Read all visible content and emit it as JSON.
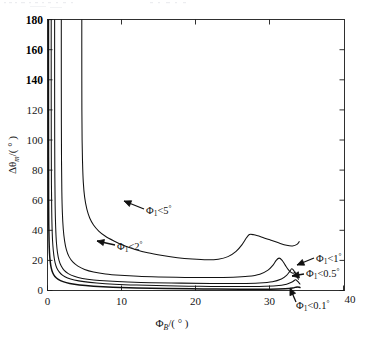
{
  "figure": {
    "background": "#ffffff",
    "ink_color": "#111111",
    "width": 368,
    "height": 337
  },
  "chart_data": {
    "type": "line",
    "title": "",
    "subtitle": "",
    "xlabel": "Φ_B/(°)",
    "ylabel": "Δθ_m/(°)",
    "xlabel_parts": {
      "symbol": "Φ",
      "sub": "B",
      "unit": "/( ° )"
    },
    "ylabel_parts": {
      "symbol": "Δθ",
      "sub": "m",
      "unit": "/( ° )"
    },
    "xlim": [
      0,
      40
    ],
    "ylim": [
      0,
      180
    ],
    "xticks": [
      0,
      10,
      20,
      30,
      40
    ],
    "xticklabels": [
      "0",
      "10",
      "20",
      "30",
      "40"
    ],
    "yticks": [
      0,
      20,
      40,
      60,
      80,
      100,
      120,
      140,
      160,
      180
    ],
    "yticklabels": [
      "0",
      "20",
      "40",
      "60",
      "80",
      "100",
      "120",
      "140",
      "160",
      "180"
    ],
    "grid": false,
    "legend_position": "none",
    "box": true,
    "series": [
      {
        "name": "Φ₁<5°",
        "label_text": "Φ",
        "label_sub": "1",
        "label_rel": "<5",
        "label_deg": "°",
        "color": "#111111",
        "asymptote_x": 4.6,
        "plateau_y": 20.5,
        "points": [
          [
            4.62,
            180
          ],
          [
            4.62,
            150
          ],
          [
            4.63,
            120
          ],
          [
            4.66,
            100
          ],
          [
            4.72,
            85
          ],
          [
            4.82,
            72
          ],
          [
            5.0,
            62
          ],
          [
            5.3,
            54
          ],
          [
            5.7,
            48
          ],
          [
            6.2,
            43.5
          ],
          [
            6.9,
            39.5
          ],
          [
            7.8,
            36.0
          ],
          [
            8.9,
            33.0
          ],
          [
            10.2,
            30.0
          ],
          [
            11.8,
            27.3
          ],
          [
            13.5,
            25.0
          ],
          [
            15.5,
            23.2
          ],
          [
            17.5,
            21.8
          ],
          [
            19.5,
            20.9
          ],
          [
            21.5,
            20.4
          ],
          [
            23.0,
            20.8
          ],
          [
            24.3,
            22.5
          ],
          [
            25.4,
            26.0
          ],
          [
            26.2,
            30.5
          ],
          [
            26.8,
            35.0
          ],
          [
            27.2,
            37.2
          ],
          [
            27.8,
            37.0
          ],
          [
            28.8,
            35.6
          ],
          [
            30.0,
            33.6
          ],
          [
            31.2,
            31.5
          ],
          [
            32.2,
            30.0
          ],
          [
            33.0,
            29.6
          ],
          [
            33.6,
            30.6
          ],
          [
            33.9,
            32.5
          ]
        ]
      },
      {
        "name": "Φ₁<2°",
        "label_text": "Φ",
        "label_sub": "1",
        "label_rel": "<2",
        "label_deg": "°",
        "color": "#111111",
        "asymptote_x": 1.85,
        "plateau_y": 8.5,
        "points": [
          [
            1.86,
            180
          ],
          [
            1.86,
            140
          ],
          [
            1.87,
            110
          ],
          [
            1.89,
            85
          ],
          [
            1.93,
            66
          ],
          [
            2.0,
            52
          ],
          [
            2.12,
            41
          ],
          [
            2.3,
            33
          ],
          [
            2.55,
            27
          ],
          [
            2.9,
            22.5
          ],
          [
            3.4,
            19.0
          ],
          [
            4.1,
            16.2
          ],
          [
            5.0,
            14.0
          ],
          [
            6.2,
            12.3
          ],
          [
            7.8,
            11.0
          ],
          [
            9.8,
            10.1
          ],
          [
            12.2,
            9.4
          ],
          [
            15.0,
            9.0
          ],
          [
            18.5,
            8.7
          ],
          [
            22.0,
            8.6
          ],
          [
            25.0,
            8.8
          ],
          [
            27.0,
            9.4
          ],
          [
            28.6,
            10.8
          ],
          [
            29.7,
            13.5
          ],
          [
            30.4,
            17.0
          ],
          [
            30.8,
            20.0
          ],
          [
            31.2,
            21.5
          ],
          [
            31.6,
            20.0
          ],
          [
            32.0,
            17.0
          ],
          [
            32.4,
            14.0
          ],
          [
            32.8,
            12.0
          ],
          [
            33.1,
            11.4
          ],
          [
            33.4,
            12.2
          ]
        ]
      },
      {
        "name": "Φ₁<1°",
        "label_text": "Φ",
        "label_sub": "1",
        "label_rel": "<1",
        "label_deg": "°",
        "color": "#111111",
        "asymptote_x": 0.95,
        "plateau_y": 4.4,
        "points": [
          [
            0.96,
            180
          ],
          [
            0.96,
            135
          ],
          [
            0.97,
            100
          ],
          [
            0.99,
            75
          ],
          [
            1.03,
            56
          ],
          [
            1.1,
            42
          ],
          [
            1.2,
            32
          ],
          [
            1.35,
            25
          ],
          [
            1.55,
            20
          ],
          [
            1.85,
            16.2
          ],
          [
            2.25,
            13.3
          ],
          [
            2.8,
            11.2
          ],
          [
            3.6,
            9.4
          ],
          [
            4.7,
            8.0
          ],
          [
            6.2,
            7.0
          ],
          [
            8.2,
            6.3
          ],
          [
            10.8,
            5.7
          ],
          [
            14.0,
            5.2
          ],
          [
            18.0,
            4.9
          ],
          [
            22.0,
            4.7
          ],
          [
            26.0,
            4.7
          ],
          [
            28.5,
            5.0
          ],
          [
            30.3,
            5.8
          ],
          [
            31.5,
            7.6
          ],
          [
            32.2,
            10.0
          ],
          [
            32.6,
            12.5
          ],
          [
            32.9,
            14.4
          ],
          [
            33.2,
            13.0
          ],
          [
            33.5,
            10.0
          ],
          [
            33.8,
            7.5
          ]
        ]
      },
      {
        "name": "Φ₁<0.5°",
        "label_text": "Φ",
        "label_sub": "1",
        "label_rel": "<0.5",
        "label_deg": "°",
        "color": "#111111",
        "asymptote_x": 0.5,
        "plateau_y": 2.4,
        "points": [
          [
            0.5,
            180
          ],
          [
            0.5,
            130
          ],
          [
            0.51,
            95
          ],
          [
            0.53,
            70
          ],
          [
            0.57,
            52
          ],
          [
            0.63,
            39
          ],
          [
            0.72,
            30
          ],
          [
            0.85,
            23.5
          ],
          [
            1.02,
            18.5
          ],
          [
            1.25,
            15.0
          ],
          [
            1.6,
            12.2
          ],
          [
            2.05,
            10.0
          ],
          [
            2.7,
            8.3
          ],
          [
            3.6,
            7.0
          ],
          [
            4.9,
            5.9
          ],
          [
            6.6,
            5.0
          ],
          [
            9.0,
            4.2
          ],
          [
            12.0,
            3.6
          ],
          [
            16.0,
            3.1
          ],
          [
            20.5,
            2.8
          ],
          [
            25.0,
            2.6
          ],
          [
            28.5,
            2.7
          ],
          [
            30.8,
            3.1
          ],
          [
            32.2,
            4.2
          ],
          [
            33.0,
            5.8
          ],
          [
            33.4,
            7.2
          ],
          [
            33.7,
            6.0
          ],
          [
            34.0,
            4.3
          ]
        ]
      },
      {
        "name": "Φ₁<0.1°",
        "label_text": "Φ",
        "label_sub": "1",
        "label_rel": "<0.1",
        "label_deg": "°",
        "color": "#111111",
        "asymptote_x": 0.12,
        "plateau_y": 0.8,
        "points": [
          [
            0.13,
            180
          ],
          [
            0.13,
            120
          ],
          [
            0.14,
            85
          ],
          [
            0.15,
            60
          ],
          [
            0.17,
            44
          ],
          [
            0.21,
            33
          ],
          [
            0.27,
            25
          ],
          [
            0.36,
            19.5
          ],
          [
            0.5,
            15.0
          ],
          [
            0.7,
            11.8
          ],
          [
            1.0,
            9.3
          ],
          [
            1.45,
            7.4
          ],
          [
            2.1,
            5.9
          ],
          [
            3.0,
            4.7
          ],
          [
            4.3,
            3.7
          ],
          [
            6.2,
            2.9
          ],
          [
            8.8,
            2.2
          ],
          [
            12.0,
            1.7
          ],
          [
            16.0,
            1.3
          ],
          [
            21.0,
            1.0
          ],
          [
            26.0,
            0.85
          ],
          [
            30.0,
            0.85
          ],
          [
            32.0,
            1.1
          ],
          [
            33.0,
            1.6
          ],
          [
            33.6,
            2.4
          ],
          [
            34.0,
            2.0
          ]
        ]
      }
    ],
    "annotations": [
      {
        "id": "annot-phi1-lt-5",
        "text": "Φ₁<5°",
        "sym": "Φ",
        "sub": "1",
        "rel": "<5",
        "deg": "°",
        "label_x": 146,
        "label_y": 214,
        "arrow_from": [
          144,
          209
        ],
        "arrow_to": [
          124,
          201
        ]
      },
      {
        "id": "annot-phi1-lt-2",
        "text": "Φ₁<2°",
        "sym": "Φ",
        "sub": "1",
        "rel": "<2",
        "deg": "°",
        "label_x": 117,
        "label_y": 250,
        "arrow_from": [
          115,
          245
        ],
        "arrow_to": [
          97,
          241
        ]
      },
      {
        "id": "annot-phi1-lt-1",
        "text": "Φ₁<1°",
        "sym": "Φ",
        "sub": "1",
        "rel": "<1",
        "deg": "°",
        "label_x": 316,
        "label_y": 262,
        "arrow_from": [
          314,
          258
        ],
        "arrow_to": [
          297,
          265
        ]
      },
      {
        "id": "annot-phi1-lt-05",
        "text": "Φ₁<0.5°",
        "sym": "Φ",
        "sub": "1",
        "rel": "<0.5",
        "deg": "°",
        "label_x": 306,
        "label_y": 277,
        "arrow_from": [
          304,
          274
        ],
        "arrow_to": [
          292,
          276
        ]
      },
      {
        "id": "annot-phi1-lt-01",
        "text": "Φ₁<0.1°",
        "sym": "Φ",
        "sub": "1",
        "rel": "<0.1",
        "deg": "°",
        "label_x": 296,
        "label_y": 309,
        "arrow_from": [
          296,
          302
        ],
        "arrow_to": [
          290,
          288
        ]
      }
    ]
  }
}
